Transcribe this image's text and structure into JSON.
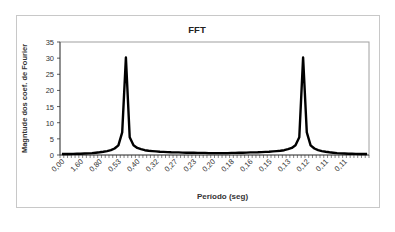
{
  "chart_data": {
    "type": "line",
    "title": "FFT",
    "xlabel": "Período (seg)",
    "ylabel": "Magntude dos coef. de Fourier",
    "ylim": [
      0,
      35
    ],
    "yticks": [
      0,
      5,
      10,
      15,
      20,
      25,
      30,
      35
    ],
    "grid": false,
    "legend": null,
    "x_tick_labels": [
      "0,00",
      "1,60",
      "0,80",
      "0,53",
      "0,40",
      "0,32",
      "0,27",
      "0,23",
      "0,20",
      "0,18",
      "0,16",
      "0,15",
      "0,13",
      "0,12",
      "0,11",
      "0,11"
    ],
    "x_tick_label_every": 5,
    "n_points": 82,
    "series": [
      {
        "name": "FFT",
        "color": "#000000",
        "values": [
          0.3,
          0.3,
          0.3,
          0.35,
          0.4,
          0.4,
          0.45,
          0.5,
          0.6,
          0.7,
          0.85,
          1.0,
          1.2,
          1.5,
          2.0,
          3.0,
          7.0,
          30.2,
          5.5,
          3.0,
          2.2,
          1.8,
          1.5,
          1.3,
          1.2,
          1.1,
          1.0,
          0.95,
          0.9,
          0.85,
          0.8,
          0.8,
          0.75,
          0.7,
          0.7,
          0.7,
          0.65,
          0.65,
          0.65,
          0.6,
          0.6,
          0.6,
          0.6,
          0.6,
          0.6,
          0.65,
          0.65,
          0.7,
          0.7,
          0.75,
          0.8,
          0.8,
          0.85,
          0.9,
          0.95,
          1.0,
          1.1,
          1.2,
          1.3,
          1.5,
          1.8,
          2.2,
          3.0,
          5.5,
          30.2,
          7.0,
          3.0,
          2.0,
          1.5,
          1.2,
          1.0,
          0.85,
          0.7,
          0.6,
          0.5,
          0.45,
          0.4,
          0.4,
          0.35,
          0.3,
          0.3,
          0.3
        ]
      }
    ]
  }
}
